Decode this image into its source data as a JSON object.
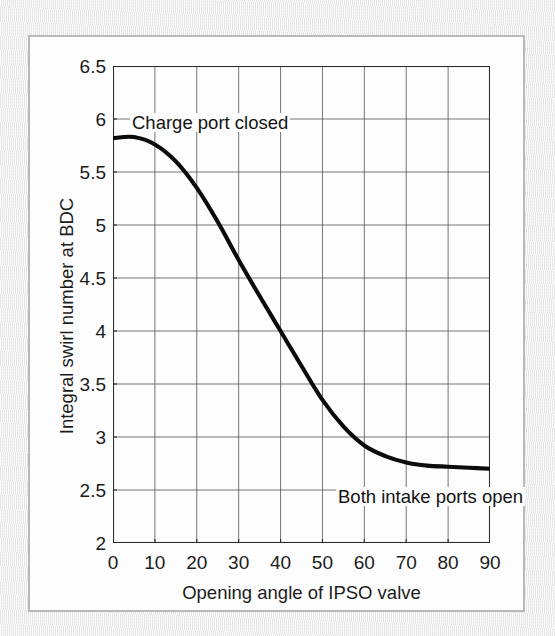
{
  "figure": {
    "background_color": "#ededed",
    "frame_color": "#b9b9b9",
    "plot_background": "#fdfdfd"
  },
  "chart_data": {
    "type": "line",
    "title": "",
    "subtitle": "",
    "xlabel": "Opening angle of IPSO valve",
    "ylabel": "Integral swirl number at BDC",
    "xlim": [
      0,
      90
    ],
    "ylim": [
      2,
      6.5
    ],
    "xticks": [
      0,
      10,
      20,
      30,
      40,
      50,
      60,
      70,
      80,
      90
    ],
    "yticks": [
      2,
      2.5,
      3,
      3.5,
      4,
      4.5,
      5,
      5.5,
      6,
      6.5
    ],
    "xtick_labels": [
      "0",
      "10",
      "20",
      "30",
      "40",
      "50",
      "60",
      "70",
      "80",
      "90"
    ],
    "ytick_labels": [
      "2",
      "2.5",
      "3",
      "3.5",
      "4",
      "4.5",
      "5",
      "5.5",
      "6",
      "6.5"
    ],
    "grid": true,
    "grid_color": "#4a4a4a",
    "legend": null,
    "series": [
      {
        "name": "Integral swirl number at BDC",
        "color": "#0b0b0b",
        "line_width": 4.1,
        "x": [
          0,
          5,
          10,
          15,
          20,
          25,
          30,
          35,
          40,
          45,
          50,
          55,
          60,
          65,
          70,
          75,
          80,
          85,
          90
        ],
        "values": [
          5.82,
          5.83,
          5.76,
          5.6,
          5.35,
          5.03,
          4.67,
          4.33,
          4.0,
          3.67,
          3.35,
          3.1,
          2.92,
          2.82,
          2.76,
          2.73,
          2.72,
          2.71,
          2.7
        ]
      }
    ],
    "annotations": [
      {
        "text": "Charge port closed",
        "x": 2,
        "y": 6.05,
        "align": "left"
      },
      {
        "text": "Both intake ports open",
        "x": 46,
        "y": 2.62,
        "align": "left"
      }
    ]
  }
}
